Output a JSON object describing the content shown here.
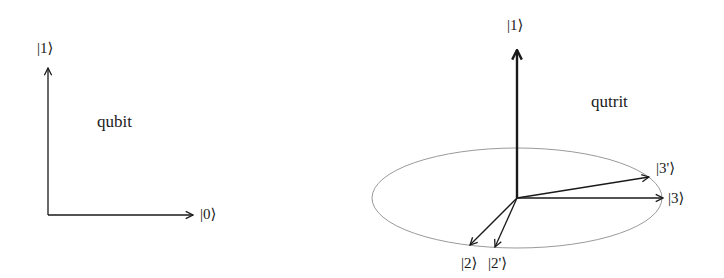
{
  "qubit_panel": {
    "title": "qubit",
    "axis_vertical_label": "|1⟩",
    "axis_horizontal_label": "|0⟩"
  },
  "qutrit_panel": {
    "title": "qutrit",
    "axis_vertical_label": "|1⟩",
    "vectors": [
      {
        "label": "|3'⟩"
      },
      {
        "label": "|3⟩"
      },
      {
        "label": "|2⟩"
      },
      {
        "label": "|2'⟩"
      }
    ]
  },
  "colors": {
    "ink": "#1a1a1a",
    "ellipse": "#9a9a9a",
    "background": "#ffffff"
  }
}
